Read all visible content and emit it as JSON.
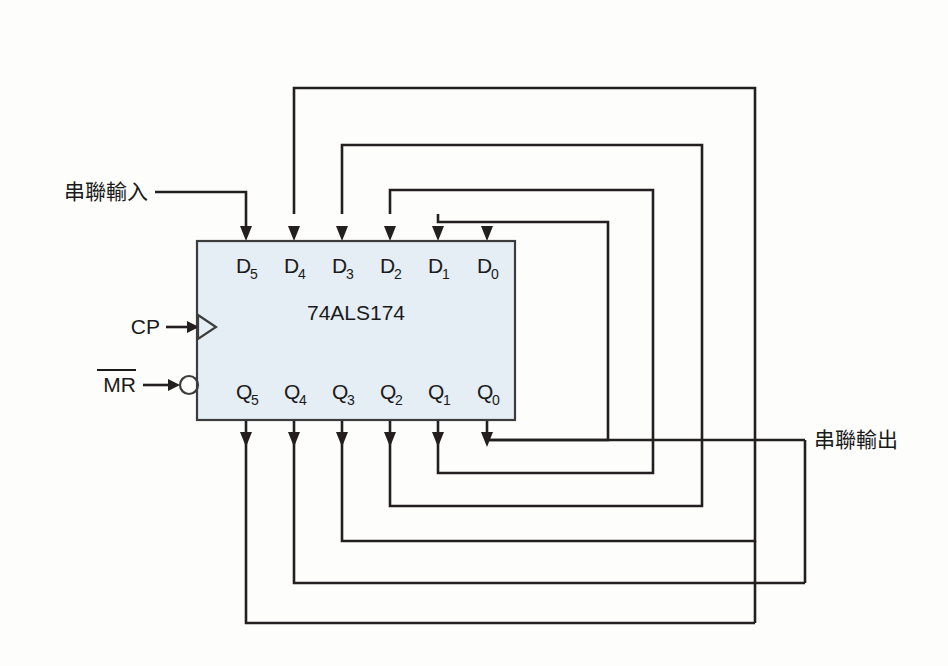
{
  "diagram": {
    "chip": {
      "name": "74ALS174",
      "fill_color": "#e4eef4",
      "stroke_color": "#3c3c3c"
    },
    "wire_color": "#231f20",
    "background_color": "#fdfdfc",
    "data_pins": [
      {
        "base": "D",
        "sub": "5"
      },
      {
        "base": "D",
        "sub": "4"
      },
      {
        "base": "D",
        "sub": "3"
      },
      {
        "base": "D",
        "sub": "2"
      },
      {
        "base": "D",
        "sub": "1"
      },
      {
        "base": "D",
        "sub": "0"
      }
    ],
    "output_pins": [
      {
        "base": "Q",
        "sub": "5"
      },
      {
        "base": "Q",
        "sub": "4"
      },
      {
        "base": "Q",
        "sub": "3"
      },
      {
        "base": "Q",
        "sub": "2"
      },
      {
        "base": "Q",
        "sub": "1"
      },
      {
        "base": "Q",
        "sub": "0"
      }
    ],
    "control_pins": [
      {
        "label": "CP",
        "overbar": false,
        "shape": "clock-triangle"
      },
      {
        "label": "MR",
        "overbar": true,
        "shape": "inverting-bubble"
      }
    ],
    "serial_input_label": "串聯輸入",
    "serial_output_label": "串聯輸出"
  }
}
